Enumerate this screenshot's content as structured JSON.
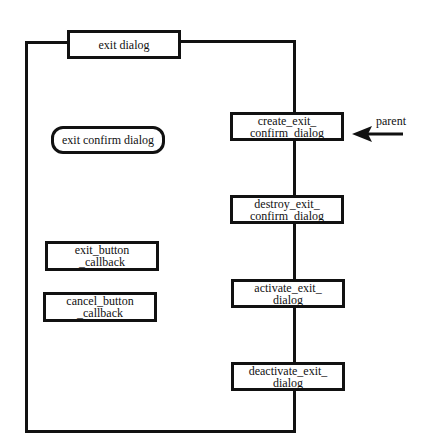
{
  "diagram": {
    "container": {
      "label": "exit dialog"
    },
    "widget": {
      "label": "exit confirm dialog"
    },
    "callbacks": [
      {
        "label": "exit_button\n_callback"
      },
      {
        "label": "cancel_button\n_callback"
      }
    ],
    "functions": [
      {
        "label": "create_exit_\nconfirm_dialog"
      },
      {
        "label": "destroy_exit_\nconfirm_dialog"
      },
      {
        "label": "activate_exit_\ndialog"
      },
      {
        "label": "deactivate_exit_\ndialog"
      }
    ],
    "external": {
      "label": "parent"
    }
  }
}
